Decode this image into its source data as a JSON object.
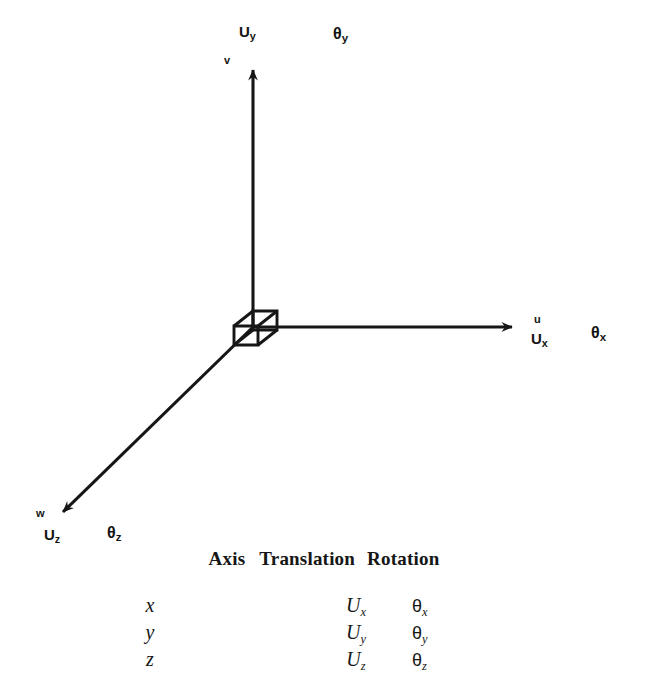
{
  "figure": {
    "background": "#ffffff",
    "line_color": "#161616",
    "axes": [
      {
        "id": "y",
        "direction": "up",
        "vector_label": "U",
        "vector_subscript": "y",
        "axis_letter": "v",
        "rotation_label": "θ",
        "rotation_subscript": "y"
      },
      {
        "id": "x",
        "direction": "right",
        "vector_label": "U",
        "vector_subscript": "x",
        "axis_letter": "u",
        "rotation_label": "θ",
        "rotation_subscript": "x"
      },
      {
        "id": "z",
        "direction": "down-left",
        "vector_label": "U",
        "vector_subscript": "z",
        "axis_letter": "w",
        "rotation_label": "θ",
        "rotation_subscript": "z"
      }
    ],
    "origin_object": "wireframe-cube"
  },
  "table": {
    "headers": {
      "axis": "Axis",
      "translation": "Translation",
      "rotation": "Rotation"
    },
    "rows": [
      {
        "axis": "x",
        "translation": "U",
        "translation_sub": "x",
        "rotation": "θ",
        "rotation_sub": "x"
      },
      {
        "axis": "y",
        "translation": "U",
        "translation_sub": "y",
        "rotation": "θ",
        "rotation_sub": "y"
      },
      {
        "axis": "z",
        "translation": "U",
        "translation_sub": "z",
        "rotation": "θ",
        "rotation_sub": "z"
      }
    ]
  }
}
